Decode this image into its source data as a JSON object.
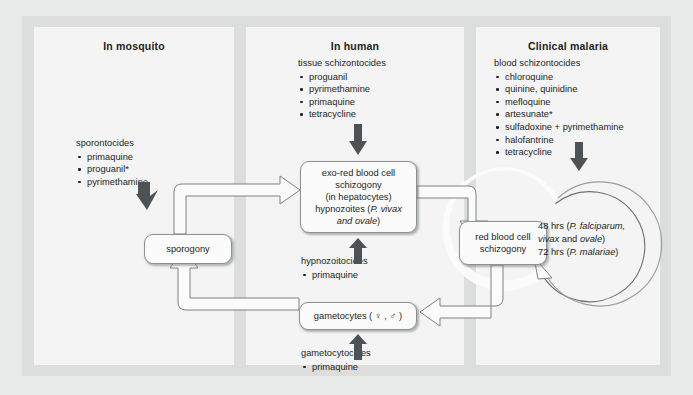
{
  "panels": [
    {
      "id": "mosquito",
      "title": "In mosquito",
      "drugs": {
        "heading": "sporontocides",
        "items": [
          "primaquine",
          "proguanil*",
          "pyrimethamine"
        ]
      }
    },
    {
      "id": "human",
      "title": "In human",
      "drugs": {
        "heading": "tissue schizontocides",
        "items": [
          "proguanil",
          "pyrimethamine",
          "primaquine",
          "tetracycline"
        ]
      }
    },
    {
      "id": "clinical",
      "title": "Clinical malaria",
      "drugs": {
        "heading": "blood schizontocides",
        "items": [
          "chloroquine",
          "quinine, quinidine",
          "mefloquine",
          "artesunate*",
          "sulfadoxine + pyrimethamine",
          "halofantrine",
          "tetracycline"
        ]
      }
    }
  ],
  "boxes": {
    "exo_red_blood_cell": {
      "line1": "exo-red blood cell",
      "line2": "schizogony",
      "line3": "(in hepatocytes)",
      "line4_pre": "hypnozoites (",
      "line4_it": "P. vivax",
      "line5_it": "and ovale",
      "line5_post": ")"
    },
    "sporogony": "sporogony",
    "red_blood_cell": {
      "line1": "red blood cell",
      "line2": "schizogony"
    },
    "gametocytes": "gametocytes ( ♀ , ♂ )"
  },
  "mid_labels": {
    "hypnozoitocides": {
      "heading": "hypnozoitocides",
      "items": [
        "primaquine"
      ]
    },
    "gametocytocides": {
      "heading": "gametocytocides",
      "items": [
        "primaquine"
      ]
    }
  },
  "cycle": {
    "line1_pre": "48 hrs (",
    "line1_it": "P. falciparum,",
    "line2_it": "vivax",
    "line2_post": " and ",
    "line2_it2": "ovale",
    "line2_end": ")",
    "line3_pre": "72 hrs (",
    "line3_it": "P. malariae",
    "line3_post": ")"
  },
  "colors": {
    "background": "#e9eaea",
    "figure_bg": "#dcdddd",
    "panel_bg": "#f4f4f4",
    "text": "#231f20",
    "arrow_dark": "#5c5f61",
    "ribbon_stroke": "#7d8082",
    "ribbon_fill": "#fbfbfb"
  }
}
